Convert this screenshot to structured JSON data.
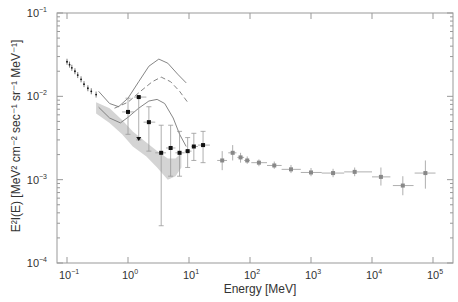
{
  "chart_data": {
    "type": "scatter",
    "title": "",
    "xlabel": "Energy [MeV]",
    "ylabel": "E²I(E) [MeV² cm⁻² sec⁻¹ sr⁻¹ MeV⁻¹]",
    "xscale": "log",
    "yscale": "log",
    "xlim": [
      0.08,
      200000
    ],
    "ylim": [
      0.0001,
      0.1
    ],
    "x_ticks": [
      "10^-1",
      "10^0",
      "10^1",
      "10^2",
      "10^3",
      "10^4",
      "10^5"
    ],
    "y_ticks": [
      "10^-4",
      "10^-3",
      "10^-2",
      "10^-1"
    ],
    "grid": false,
    "legend": null,
    "series": [
      {
        "name": "low-energy points (small dots)",
        "style": "small black dots with vertical error bars",
        "points": [
          {
            "x": 0.1,
            "y": 0.026
          },
          {
            "x": 0.11,
            "y": 0.024
          },
          {
            "x": 0.12,
            "y": 0.022
          },
          {
            "x": 0.135,
            "y": 0.02
          },
          {
            "x": 0.15,
            "y": 0.018
          },
          {
            "x": 0.17,
            "y": 0.016
          },
          {
            "x": 0.19,
            "y": 0.014
          },
          {
            "x": 0.22,
            "y": 0.0125
          },
          {
            "x": 0.25,
            "y": 0.0115
          },
          {
            "x": 0.3,
            "y": 0.0105
          }
        ]
      },
      {
        "name": "black data points",
        "style": "black filled squares with error bars",
        "points": [
          {
            "x": 1.0,
            "y": 0.0065,
            "ylo": 0.0035,
            "yhi": 0.0095,
            "xlo": 0.8,
            "xhi": 1.25
          },
          {
            "x": 1.5,
            "y": 0.0098,
            "ylo": 0.003,
            "yhi": 0.0098,
            "xlo": 1.25,
            "xhi": 2.0,
            "upper_limit_arrow": true
          },
          {
            "x": 2.2,
            "y": 0.0049,
            "ylo": 0.0022,
            "yhi": 0.0075,
            "xlo": 1.8,
            "xhi": 2.8
          },
          {
            "x": 3.5,
            "y": 0.0021,
            "ylo": 0.00028,
            "yhi": 0.0045,
            "xlo": 2.8,
            "xhi": 4.2
          },
          {
            "x": 5.0,
            "y": 0.0024,
            "ylo": 0.0011,
            "yhi": 0.0045,
            "xlo": 4.2,
            "xhi": 6.0
          },
          {
            "x": 7.0,
            "y": 0.0021,
            "ylo": 0.0011,
            "yhi": 0.0038,
            "xlo": 6.0,
            "xhi": 8.5
          },
          {
            "x": 9.5,
            "y": 0.0022,
            "ylo": 0.0014,
            "yhi": 0.0032,
            "xlo": 8.5,
            "xhi": 11
          },
          {
            "x": 12,
            "y": 0.0025,
            "ylo": 0.0017,
            "yhi": 0.0036,
            "xlo": 11,
            "xhi": 14
          },
          {
            "x": 17,
            "y": 0.0026,
            "ylo": 0.0016,
            "yhi": 0.0038,
            "xlo": 14,
            "xhi": 22
          }
        ]
      },
      {
        "name": "grey data points",
        "style": "grey filled squares with error bars",
        "points": [
          {
            "x": 35,
            "y": 0.0017,
            "ylo": 0.0013,
            "yhi": 0.0022,
            "xlo": 29,
            "xhi": 42
          },
          {
            "x": 52,
            "y": 0.0021,
            "ylo": 0.0017,
            "yhi": 0.0026,
            "xlo": 44,
            "xhi": 60
          },
          {
            "x": 70,
            "y": 0.00185,
            "ylo": 0.0016,
            "yhi": 0.0021,
            "xlo": 62,
            "xhi": 80
          },
          {
            "x": 90,
            "y": 0.0017,
            "ylo": 0.00155,
            "yhi": 0.0019,
            "xlo": 80,
            "xhi": 100
          },
          {
            "x": 140,
            "y": 0.0016,
            "ylo": 0.00145,
            "yhi": 0.00175,
            "xlo": 105,
            "xhi": 190
          },
          {
            "x": 250,
            "y": 0.00148,
            "ylo": 0.00135,
            "yhi": 0.00165,
            "xlo": 190,
            "xhi": 330
          },
          {
            "x": 470,
            "y": 0.00133,
            "ylo": 0.0012,
            "yhi": 0.0015,
            "xlo": 330,
            "xhi": 680
          },
          {
            "x": 1000,
            "y": 0.00122,
            "ylo": 0.0011,
            "yhi": 0.00138,
            "xlo": 680,
            "xhi": 1500
          },
          {
            "x": 2300,
            "y": 0.0012,
            "ylo": 0.00107,
            "yhi": 0.00135,
            "xlo": 1500,
            "xhi": 3500
          },
          {
            "x": 5200,
            "y": 0.00124,
            "ylo": 0.0011,
            "yhi": 0.0014,
            "xlo": 3500,
            "xhi": 10000
          },
          {
            "x": 14000,
            "y": 0.00108,
            "ylo": 0.00085,
            "yhi": 0.0014,
            "xlo": 10000,
            "xhi": 20000
          },
          {
            "x": 32000,
            "y": 0.00085,
            "ylo": 0.00065,
            "yhi": 0.0011,
            "xlo": 22000,
            "xhi": 48000
          },
          {
            "x": 75000,
            "y": 0.0012,
            "ylo": 0.00078,
            "yhi": 0.0017,
            "xlo": 50000,
            "xhi": 110000
          }
        ]
      },
      {
        "name": "upper solid curve",
        "style": "thin grey solid line",
        "points": [
          {
            "x": 0.33,
            "y": 0.0115
          },
          {
            "x": 0.5,
            "y": 0.0082
          },
          {
            "x": 0.7,
            "y": 0.0075
          },
          {
            "x": 1.0,
            "y": 0.0095
          },
          {
            "x": 1.5,
            "y": 0.015
          },
          {
            "x": 2.2,
            "y": 0.023
          },
          {
            "x": 3.2,
            "y": 0.028
          },
          {
            "x": 4.5,
            "y": 0.025
          },
          {
            "x": 6.5,
            "y": 0.0185
          },
          {
            "x": 9.0,
            "y": 0.0145
          }
        ]
      },
      {
        "name": "dashed curve",
        "style": "thin grey dashed line",
        "points": [
          {
            "x": 0.6,
            "y": 0.0072
          },
          {
            "x": 1.0,
            "y": 0.0085
          },
          {
            "x": 1.6,
            "y": 0.0115
          },
          {
            "x": 2.5,
            "y": 0.015
          },
          {
            "x": 3.5,
            "y": 0.017
          },
          {
            "x": 5.0,
            "y": 0.015
          },
          {
            "x": 7.0,
            "y": 0.0115
          },
          {
            "x": 9.5,
            "y": 0.0085
          }
        ]
      },
      {
        "name": "lower solid curve",
        "style": "thin grey solid line",
        "points": [
          {
            "x": 0.33,
            "y": 0.0074
          },
          {
            "x": 0.5,
            "y": 0.0055
          },
          {
            "x": 0.75,
            "y": 0.0048
          },
          {
            "x": 1.0,
            "y": 0.0056
          },
          {
            "x": 1.5,
            "y": 0.0072
          },
          {
            "x": 2.2,
            "y": 0.0088
          },
          {
            "x": 3.0,
            "y": 0.0092
          },
          {
            "x": 4.0,
            "y": 0.0082
          },
          {
            "x": 5.5,
            "y": 0.0055
          },
          {
            "x": 7.0,
            "y": 0.0035
          },
          {
            "x": 9.0,
            "y": 0.0025
          }
        ]
      },
      {
        "name": "grey shaded band",
        "style": "light grey filled region",
        "upper": [
          {
            "x": 0.3,
            "y": 0.0085
          },
          {
            "x": 0.5,
            "y": 0.0072
          },
          {
            "x": 0.8,
            "y": 0.0052
          },
          {
            "x": 1.2,
            "y": 0.0038
          },
          {
            "x": 2.0,
            "y": 0.0028
          },
          {
            "x": 3.0,
            "y": 0.0022
          },
          {
            "x": 4.5,
            "y": 0.0018
          },
          {
            "x": 6.0,
            "y": 0.0018
          },
          {
            "x": 7.5,
            "y": 0.0021
          }
        ],
        "lower": [
          {
            "x": 7.5,
            "y": 0.0014
          },
          {
            "x": 6.0,
            "y": 0.0011
          },
          {
            "x": 4.5,
            "y": 0.001
          },
          {
            "x": 3.0,
            "y": 0.0014
          },
          {
            "x": 2.0,
            "y": 0.0019
          },
          {
            "x": 1.2,
            "y": 0.0025
          },
          {
            "x": 0.8,
            "y": 0.0035
          },
          {
            "x": 0.5,
            "y": 0.0048
          },
          {
            "x": 0.3,
            "y": 0.0062
          }
        ]
      }
    ]
  },
  "axes": {
    "x_label_text": "Energy [MeV]",
    "y_label_text": "E²I(E) [MeV² cm⁻² sec⁻¹ sr⁻¹ MeV⁻¹]",
    "x_tick_labels": [
      {
        "base": "10",
        "exp": "−1",
        "value": 0.1
      },
      {
        "base": "10",
        "exp": "0",
        "value": 1
      },
      {
        "base": "10",
        "exp": "1",
        "value": 10
      },
      {
        "base": "10",
        "exp": "2",
        "value": 100
      },
      {
        "base": "10",
        "exp": "3",
        "value": 1000
      },
      {
        "base": "10",
        "exp": "4",
        "value": 10000
      },
      {
        "base": "10",
        "exp": "5",
        "value": 100000
      }
    ],
    "y_tick_labels": [
      {
        "base": "10",
        "exp": "−1",
        "value": 0.1
      },
      {
        "base": "10",
        "exp": "−2",
        "value": 0.01
      },
      {
        "base": "10",
        "exp": "−3",
        "value": 0.001
      },
      {
        "base": "10",
        "exp": "−4",
        "value": 0.0001
      }
    ]
  },
  "colors": {
    "axis": "#999999",
    "text": "#333333",
    "black_points": "#111111",
    "grey_points": "#888888",
    "curves": "#777777",
    "band": "#d4d4d4"
  }
}
